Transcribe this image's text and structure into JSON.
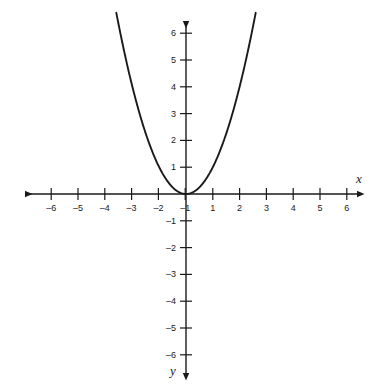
{
  "chart_data": {
    "type": "line",
    "title": "",
    "subtitle": "",
    "xlabel": "x",
    "ylabel": "y",
    "function": "y = x^2",
    "equation_display": "y = x²",
    "xlim": [
      -6.5,
      6.5
    ],
    "ylim": [
      -6.5,
      6.5
    ],
    "y_axis_direction": "down-positive-label-at-bottom",
    "grid": false,
    "legend": null,
    "x_ticks": [
      -6,
      -5,
      -4,
      -3,
      -2,
      -1,
      1,
      2,
      3,
      4,
      5,
      6
    ],
    "x_tick_labels": [
      "–6",
      "–5",
      "–4",
      "–3",
      "–2",
      "–1",
      "1",
      "2",
      "3",
      "4",
      "5",
      "6"
    ],
    "y_ticks": [
      6,
      5,
      4,
      3,
      2,
      1,
      -1,
      -2,
      -3,
      -4,
      -5,
      -6
    ],
    "y_tick_labels": [
      "6",
      "5",
      "4",
      "3",
      "2",
      "1",
      "–1",
      "–2",
      "–3",
      "–4",
      "–5",
      "–6"
    ],
    "series": [
      {
        "name": "y = x²",
        "color": "#1a1a1a",
        "x_domain": [
          -2.6,
          2.6
        ],
        "x": [
          -2.6,
          -2.4,
          -2.2,
          -2.0,
          -1.8,
          -1.6,
          -1.4,
          -1.2,
          -1.0,
          -0.8,
          -0.6,
          -0.4,
          -0.2,
          0.0,
          0.2,
          0.4,
          0.6,
          0.8,
          1.0,
          1.2,
          1.4,
          1.6,
          1.8,
          2.0,
          2.2,
          2.4,
          2.6
        ],
        "values": [
          6.76,
          5.76,
          4.84,
          4.0,
          3.24,
          2.56,
          1.96,
          1.44,
          1.0,
          0.64,
          0.36,
          0.16,
          0.04,
          0.0,
          0.04,
          0.16,
          0.36,
          0.64,
          1.0,
          1.44,
          1.96,
          2.56,
          3.24,
          4.0,
          4.84,
          5.76,
          6.76
        ]
      }
    ],
    "vertex": [
      0,
      0
    ],
    "annotations": []
  },
  "axes": {
    "x_label": "x",
    "y_label": "y",
    "axis_color": "#1a1a1a",
    "curve_color": "#1a1a1a",
    "background": "#ffffff",
    "origin_px": [
      186,
      194
    ],
    "unit_px": 26.8
  }
}
